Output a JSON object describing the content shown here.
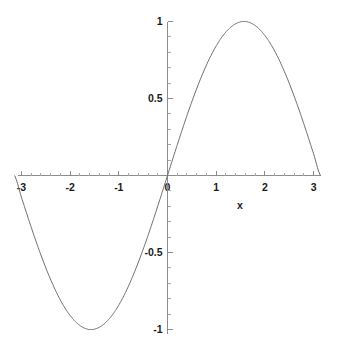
{
  "chart_data": {
    "type": "line",
    "title": "",
    "subtitle": "",
    "xlabel": "x",
    "ylabel": "",
    "function": "sin(x)",
    "xlim": [
      -3.14159265,
      3.14159265
    ],
    "ylim": [
      -1,
      1
    ],
    "grid": false,
    "legend": false,
    "legend_position": "none",
    "x_ticks": [
      -3,
      -2,
      -1,
      0,
      1,
      2,
      3
    ],
    "x_tick_labels": [
      "-3",
      "-2",
      "-1",
      "0",
      "1",
      "2",
      "3"
    ],
    "y_ticks": [
      -1,
      -0.5,
      0.5,
      1
    ],
    "y_tick_labels": [
      "-1",
      "-0.5",
      "0.5",
      "1"
    ],
    "x_minor_tick_step": 0.2,
    "y_minor_tick_step": 0.1,
    "series": [
      {
        "name": "sin(x)",
        "color": "#6e6e6e",
        "x": [
          -3.14159265,
          -3.0,
          -2.85,
          -2.7,
          -2.55,
          -2.4,
          -2.25,
          -2.1,
          -1.95,
          -1.8,
          -1.65,
          -1.5708,
          -1.5,
          -1.35,
          -1.2,
          -1.05,
          -0.9,
          -0.75,
          -0.6,
          -0.45,
          -0.3,
          -0.15,
          0,
          0.15,
          0.3,
          0.45,
          0.6,
          0.75,
          0.9,
          1.05,
          1.2,
          1.35,
          1.5,
          1.5708,
          1.65,
          1.8,
          1.95,
          2.1,
          2.25,
          2.4,
          2.55,
          2.7,
          2.85,
          3.0,
          3.14159265
        ],
        "values": [
          0,
          -0.1411,
          -0.2867,
          -0.4274,
          -0.5578,
          -0.6755,
          -0.7781,
          -0.8632,
          -0.9284,
          -0.9738,
          -0.9969,
          -1.0,
          -0.9975,
          -0.9757,
          -0.932,
          -0.8674,
          -0.7833,
          -0.6816,
          -0.5646,
          -0.435,
          -0.2955,
          -0.1494,
          0,
          0.1494,
          0.2955,
          0.435,
          0.5646,
          0.6816,
          0.7833,
          0.8674,
          0.932,
          0.9757,
          0.9975,
          1.0,
          0.9969,
          0.9738,
          0.9284,
          0.8632,
          0.7781,
          0.6755,
          0.5578,
          0.4274,
          0.2867,
          0.1411,
          0
        ]
      }
    ],
    "annotations": [
      {
        "text": "x",
        "x": 0.95,
        "y": -0.18,
        "role": "x-axis-label"
      }
    ],
    "colors": {
      "curve": "#6e6e6e",
      "axis": "#8c8c8c",
      "tick": "#8c8c8c",
      "minor_tick": "#a8a8a8",
      "text": "#1a1a1a",
      "background": "#ffffff"
    }
  }
}
